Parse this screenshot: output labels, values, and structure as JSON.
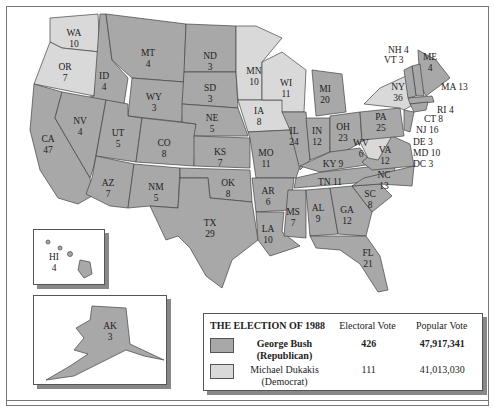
{
  "legend": {
    "title": "THE ELECTION OF 1988",
    "col_electoral": "Electoral Vote",
    "col_popular": "Popular Vote",
    "candidates": [
      {
        "name": "George Bush",
        "party": "(Republican)",
        "electoral": "426",
        "popular": "47,917,341",
        "color": "#a8a8a8"
      },
      {
        "name": "Michael Dukakis",
        "party": "(Democrat)",
        "electoral": "111",
        "popular": "41,013,030",
        "color": "#d9d9d9"
      }
    ]
  },
  "states": {
    "WA": "WA",
    "WA_v": "10",
    "OR": "OR",
    "OR_v": "7",
    "CA": "CA",
    "CA_v": "47",
    "ID": "ID",
    "ID_v": "4",
    "NV": "NV",
    "NV_v": "4",
    "MT": "MT",
    "MT_v": "4",
    "WY": "WY",
    "WY_v": "3",
    "UT": "UT",
    "UT_v": "5",
    "AZ": "AZ",
    "AZ_v": "7",
    "CO": "CO",
    "CO_v": "8",
    "NM": "NM",
    "NM_v": "5",
    "ND": "ND",
    "ND_v": "3",
    "SD": "SD",
    "SD_v": "3",
    "NE": "NE",
    "NE_v": "5",
    "KS": "KS",
    "KS_v": "7",
    "OK": "OK",
    "OK_v": "8",
    "TX": "TX",
    "TX_v": "29",
    "MN": "MN",
    "MN_v": "10",
    "IA": "IA",
    "IA_v": "8",
    "MO": "MO",
    "MO_v": "11",
    "AR": "AR",
    "AR_v": "6",
    "LA": "LA",
    "LA_v": "10",
    "WI": "WI",
    "WI_v": "11",
    "IL": "IL",
    "IL_v": "24",
    "MI": "MI",
    "MI_v": "20",
    "IN": "IN",
    "IN_v": "12",
    "OH": "OH",
    "OH_v": "23",
    "KY": "KY 9",
    "TN": "TN 11",
    "MS": "MS",
    "MS_v": "7",
    "AL": "AL",
    "AL_v": "9",
    "GA": "GA",
    "GA_v": "12",
    "FL": "FL",
    "FL_v": "21",
    "SC": "SC",
    "SC_v": "8",
    "NC": "NC",
    "NC_v": "13",
    "VA": "VA",
    "VA_v": "12",
    "WV": "WV",
    "WV_v": "6",
    "PA": "PA",
    "PA_v": "25",
    "NY": "NY",
    "NY_v": "36",
    "ME": "ME",
    "ME_v": "4",
    "NH": "NH 4",
    "VT": "VT 3",
    "MA": "MA 13",
    "RI": "RI 4",
    "CT": "CT 8",
    "NJ": "NJ 16",
    "DE": "DE 3",
    "MD": "MD 10",
    "DC": "DC 3",
    "HI": "HI",
    "HI_v": "4",
    "AK": "AK",
    "AK_v": "3"
  }
}
